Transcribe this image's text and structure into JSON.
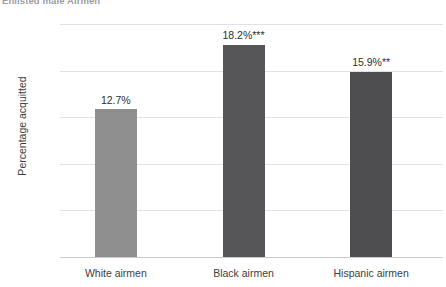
{
  "chart_data": {
    "type": "bar",
    "title": "Enlisted male Airmen",
    "xlabel": "",
    "ylabel": "Percentage acquitted",
    "categories": [
      "White airmen",
      "Black airmen",
      "Hispanic airmen"
    ],
    "values": [
      12.7,
      18.2,
      15.9
    ],
    "data_labels": [
      "12.7%",
      "18.2%***",
      "15.9%**"
    ],
    "significance": [
      "",
      "***",
      "**"
    ],
    "ylim": [
      0,
      20
    ],
    "yticks": [
      0,
      4,
      8,
      12,
      16,
      20
    ],
    "ytick_labels": [
      "0",
      "4",
      "8",
      "12",
      "16",
      "20"
    ],
    "grid": true,
    "legend": "none",
    "bar_colors": [
      "#8f8f8f",
      "#565658",
      "#4e4e50"
    ],
    "gridline_color": "#e2e2e6",
    "axis_color": "#c9c9cf",
    "text_color": "#3d3d3d",
    "background": "#ffffff"
  }
}
